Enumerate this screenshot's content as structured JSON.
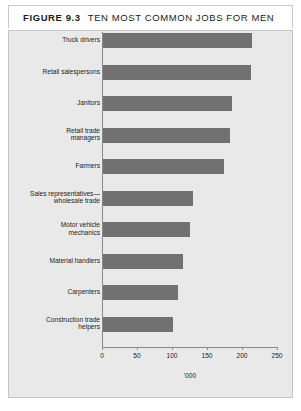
{
  "figure": {
    "tag": "FIGURE 9.3",
    "title": "TEN MOST COMMON JOBS FOR MEN"
  },
  "colors": {
    "bar_fill": "#717171",
    "panel_background": "#e9e9e9",
    "axis": "#8a8a8a",
    "title_band": "#ffffff"
  },
  "chart_data": {
    "type": "bar",
    "orientation": "horizontal",
    "title": "TEN MOST COMMON JOBS FOR MEN",
    "xlabel": "'000",
    "ylabel": "",
    "xlim": [
      0,
      250
    ],
    "xticks": [
      0,
      50,
      100,
      150,
      200,
      250
    ],
    "xtick_labels": [
      "0",
      "50",
      "100",
      "150",
      "200",
      "250"
    ],
    "grid": false,
    "legend": false,
    "categories": [
      "Truck drivers",
      "Retail salespersons",
      "Janitors",
      "Retail trade managers",
      "Farmers",
      "Sales representatives—wholesale trade",
      "Motor vehicle mechanics",
      "Material handlers",
      "Carpenters",
      "Construction trade helpers"
    ],
    "category_labels": [
      [
        "Truck drivers"
      ],
      [
        "Retail salespersons"
      ],
      [
        "Janitors"
      ],
      [
        "Retail trade",
        "managers"
      ],
      [
        "Farmers"
      ],
      [
        "Sales representatives—",
        "wholesale trade"
      ],
      [
        "Motor vehicle",
        "mechanics"
      ],
      [
        "Material handlers"
      ],
      [
        "Carpenters"
      ],
      [
        "Construction trade",
        "helpers"
      ]
    ],
    "values": [
      214,
      213,
      185,
      183,
      174,
      130,
      125,
      116,
      109,
      101
    ]
  }
}
